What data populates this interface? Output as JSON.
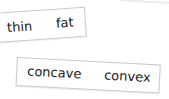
{
  "cards": [
    {
      "left_word": "thin",
      "right_word": "fat"
    },
    {
      "left_word": "concave",
      "right_word": "convex"
    }
  ]
}
